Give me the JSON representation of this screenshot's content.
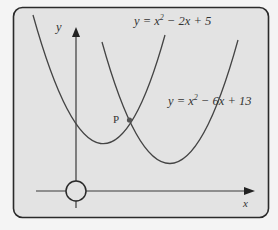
{
  "figure": {
    "background": "#f4f4f4",
    "panel_fill": "#e3e3e3",
    "stroke": "#333333",
    "axes": {
      "x_label": "x",
      "y_label": "y"
    },
    "curves": [
      {
        "name": "curve-1",
        "equation_prefix": "y = x",
        "exponent": "2",
        "equation_suffix": " − 2x + 5"
      },
      {
        "name": "curve-2",
        "equation_prefix": "y = x",
        "exponent": "2",
        "equation_suffix": " − 6x + 13"
      }
    ],
    "intersection_label": "P"
  }
}
